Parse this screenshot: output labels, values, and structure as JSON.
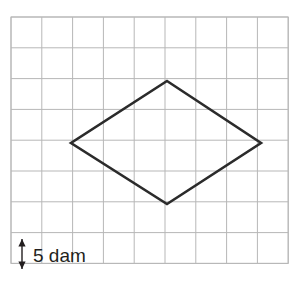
{
  "figure": {
    "background_color": "#ffffff",
    "width": 295,
    "height": 289
  },
  "grid": {
    "name": "square-grid",
    "origin_x": 11,
    "origin_y": 17,
    "cell_size": 30.8,
    "columns": 9,
    "rows": 8,
    "line_color": "#b7b7b7",
    "line_width": 1,
    "border_color": "#b7b7b7"
  },
  "shape": {
    "name": "rhombus",
    "type": "polygon",
    "stroke_color": "#2b2b2b",
    "stroke_width": 2.6,
    "fill": "none",
    "vertices": [
      {
        "label": "top",
        "x": 167,
        "y": 81
      },
      {
        "label": "right",
        "x": 261,
        "y": 143
      },
      {
        "label": "bottom",
        "x": 167,
        "y": 204
      },
      {
        "label": "left",
        "x": 71,
        "y": 143
      }
    ],
    "points_attr": "167,81 261,143 167,204 71,143",
    "diagonal_horizontal_cells": 6,
    "diagonal_vertical_cells": 4
  },
  "scale": {
    "name": "scale-indicator",
    "label": "5 dam",
    "value": 5,
    "unit": "dam",
    "unit_full": "decameter",
    "meaning": "one grid square side equals 5 dam",
    "arrow_color": "#231f20",
    "arrow_x": 22,
    "arrow_top_y": 239,
    "arrow_bottom_y": 269,
    "text_x": 33,
    "text_y": 262
  }
}
